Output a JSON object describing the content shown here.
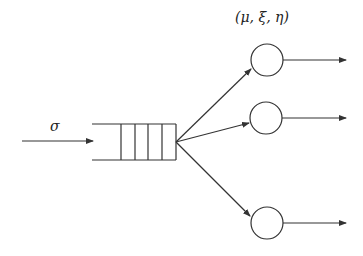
{
  "diagram": {
    "type": "queueing-network",
    "arrival_label": "σ",
    "server_params_label": "(μ, ξ, η)",
    "queue": {
      "slots": 4
    },
    "servers": [
      {
        "id": "server-1"
      },
      {
        "id": "server-2"
      },
      {
        "id": "server-3"
      }
    ],
    "colors": {
      "stroke": "#333333",
      "background": "#ffffff"
    }
  }
}
